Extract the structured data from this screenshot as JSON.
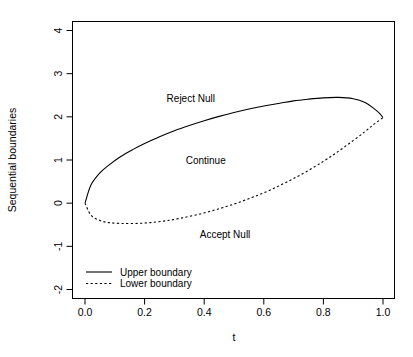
{
  "chart_data": {
    "type": "line",
    "title": "",
    "xlabel": "t",
    "ylabel": "Sequential boundaries",
    "xlim": [
      0.0,
      1.0
    ],
    "ylim": [
      -2,
      4
    ],
    "xticks": [
      "0.0",
      "0.2",
      "0.4",
      "0.6",
      "0.8",
      "1.0"
    ],
    "xtick_values": [
      0.0,
      0.2,
      0.4,
      0.6,
      0.8,
      1.0
    ],
    "yticks": [
      "4",
      "3",
      "2",
      "1",
      "0",
      "-1",
      "-2"
    ],
    "ytick_values": [
      4,
      3,
      2,
      1,
      0,
      -1,
      -2
    ],
    "grid": false,
    "legend_position": "bottom-left",
    "series": [
      {
        "name": "Upper boundary",
        "style": "solid",
        "color": "#000000",
        "x": [
          0.0,
          0.02,
          0.05,
          0.08,
          0.12,
          0.16,
          0.2,
          0.25,
          0.3,
          0.35,
          0.4,
          0.45,
          0.5,
          0.55,
          0.6,
          0.65,
          0.7,
          0.75,
          0.8,
          0.85,
          0.9,
          0.94,
          0.97,
          0.99,
          1.0
        ],
        "values": [
          0.0,
          0.42,
          0.7,
          0.88,
          1.08,
          1.24,
          1.38,
          1.54,
          1.68,
          1.8,
          1.91,
          2.01,
          2.1,
          2.18,
          2.25,
          2.31,
          2.37,
          2.41,
          2.44,
          2.45,
          2.42,
          2.33,
          2.19,
          2.07,
          1.98
        ]
      },
      {
        "name": "Lower boundary",
        "style": "dashed",
        "color": "#000000",
        "x": [
          0.0,
          0.02,
          0.05,
          0.08,
          0.12,
          0.17,
          0.22,
          0.27,
          0.32,
          0.38,
          0.44,
          0.5,
          0.56,
          0.62,
          0.68,
          0.74,
          0.8,
          0.85,
          0.9,
          0.94,
          0.97,
          1.0
        ],
        "values": [
          0.0,
          -0.28,
          -0.4,
          -0.45,
          -0.47,
          -0.47,
          -0.45,
          -0.41,
          -0.35,
          -0.26,
          -0.15,
          -0.02,
          0.13,
          0.3,
          0.5,
          0.72,
          0.97,
          1.2,
          1.45,
          1.66,
          1.83,
          1.98
        ]
      }
    ],
    "annotations": [
      {
        "text": "Reject Null",
        "x": 0.355,
        "y": 2.35
      },
      {
        "text": "Continue",
        "x": 0.405,
        "y": 0.9
      },
      {
        "text": "Accept Null",
        "x": 0.47,
        "y": -0.8
      }
    ],
    "legend": [
      {
        "label": "Upper boundary",
        "style": "solid"
      },
      {
        "label": "Lower boundary",
        "style": "dashed"
      }
    ]
  }
}
